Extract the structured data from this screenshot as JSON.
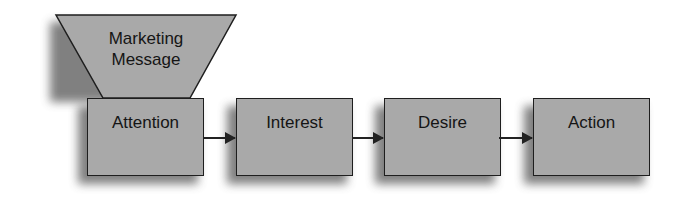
{
  "diagram": {
    "funnel": {
      "label_line1": "Marketing",
      "label_line2": "Message"
    },
    "stages": [
      {
        "label": "Attention"
      },
      {
        "label": "Interest"
      },
      {
        "label": "Desire"
      },
      {
        "label": "Action"
      }
    ],
    "colors": {
      "fill": "#a9a9a9",
      "stroke": "#1e1e1e",
      "shadow": "#6a6a6a"
    }
  }
}
